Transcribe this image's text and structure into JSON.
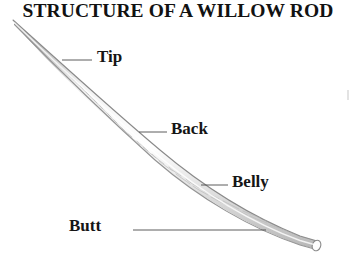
{
  "document": {
    "title": "STRUCTURE OF A WILLOW ROD",
    "background_color": "#ffffff",
    "ink_color": "#151515"
  },
  "diagram": {
    "subject": "willow rod",
    "illustration_style": "pen-and-ink hatched line drawing",
    "rod": {
      "name": "willow-rod",
      "stroke_color": "#8c8c8c",
      "shading_color": "#bdbdbd",
      "tip_point": {
        "x": 13,
        "y": 20
      },
      "butt_point": {
        "x": 318,
        "y": 244
      }
    },
    "callouts": [
      {
        "id": "tip",
        "label": "Tip",
        "leader": {
          "x1": 62,
          "y1": 60,
          "x2": 92,
          "y2": 60
        },
        "anchor": {
          "x": 62,
          "y": 60
        }
      },
      {
        "id": "back",
        "label": "Back",
        "leader": {
          "x1": 139,
          "y1": 132,
          "x2": 167,
          "y2": 132
        },
        "anchor": {
          "x": 139,
          "y": 132
        }
      },
      {
        "id": "belly",
        "label": "Belly",
        "leader": {
          "x1": 201,
          "y1": 185,
          "x2": 228,
          "y2": 185
        },
        "anchor": {
          "x": 201,
          "y": 185
        }
      },
      {
        "id": "butt",
        "label": "Butt",
        "leader": {
          "x1": 133,
          "y1": 230,
          "x2": 266,
          "y2": 230
        },
        "anchor": {
          "x": 266,
          "y": 230
        }
      }
    ]
  }
}
